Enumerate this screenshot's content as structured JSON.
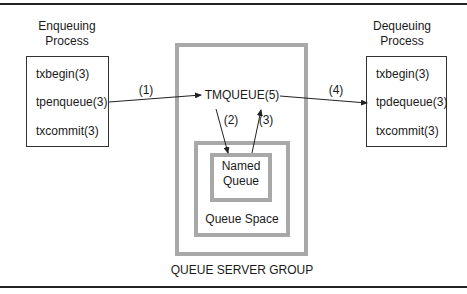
{
  "diagram": {
    "enqueuing_process": {
      "title_line1": "Enqueuing",
      "title_line2": "Process",
      "calls": [
        "txbegin(3)",
        "tpenqueue(3)",
        "txcommit(3)"
      ]
    },
    "dequeuing_process": {
      "title_line1": "Dequeuing",
      "title_line2": "Process",
      "calls": [
        "txbegin(3)",
        "tpdequeue(3)",
        "txcommit(3)"
      ]
    },
    "server": {
      "tmqueue_label": "TMQUEUE(5)",
      "named_queue_line1": "Named",
      "named_queue_line2": "Queue",
      "queue_space_label": "Queue Space",
      "group_label": "QUEUE SERVER GROUP"
    },
    "arrows": [
      {
        "label": "(1)",
        "from": "tpenqueue(3)",
        "to": "TMQUEUE(5)"
      },
      {
        "label": "(2)",
        "from": "TMQUEUE(5)",
        "to": "Named Queue"
      },
      {
        "label": "(3)",
        "from": "Named Queue",
        "to": "TMQUEUE(5)"
      },
      {
        "label": "(4)",
        "from": "TMQUEUE(5)",
        "to": "tpdequeue(3)"
      }
    ]
  }
}
